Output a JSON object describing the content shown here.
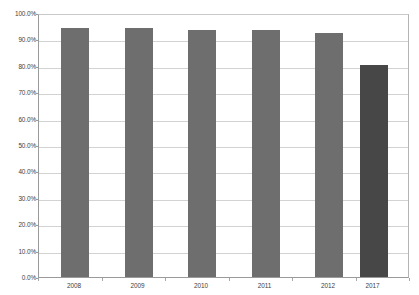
{
  "chart_data": {
    "type": "bar",
    "title": "",
    "subtitle": "",
    "xlabel": "",
    "ylabel": "",
    "categories": [
      "2008",
      "2009",
      "2010",
      "2011",
      "2012",
      "2017"
    ],
    "values": [
      95.2,
      95.1,
      94.2,
      94.2,
      93.2,
      81.0
    ],
    "series": [
      {
        "name": "",
        "values": [
          95.2,
          95.1,
          94.2,
          94.2,
          93.2,
          81.0
        ]
      }
    ],
    "ylim": [
      0,
      100
    ],
    "ytick_values": [
      0,
      10,
      20,
      30,
      40,
      50,
      60,
      70,
      80,
      90,
      100
    ],
    "ytick_labels": [
      "0.0%",
      "10.0%",
      "20.0%",
      "30.0%",
      "40.0%",
      "50.0%",
      "60.0%",
      "70.0%",
      "80.0%",
      "90.0%",
      "100.0%"
    ],
    "y_tick_step": 10,
    "grid": true,
    "grid_axis": "y",
    "legend": false,
    "legend_position": "none",
    "value_labels": false,
    "annotations": [],
    "bar_colors": [
      "#6e6e6e",
      "#6e6e6e",
      "#6e6e6e",
      "#6e6e6e",
      "#6e6e6e",
      "#474747"
    ],
    "colors": {
      "bar_default": "#6e6e6e",
      "bar_highlight": "#474747",
      "gridline": "#d2d2d2",
      "axis": "#9a9a9a",
      "tick_text": "#3d3d3d",
      "background": "#ffffff"
    }
  }
}
